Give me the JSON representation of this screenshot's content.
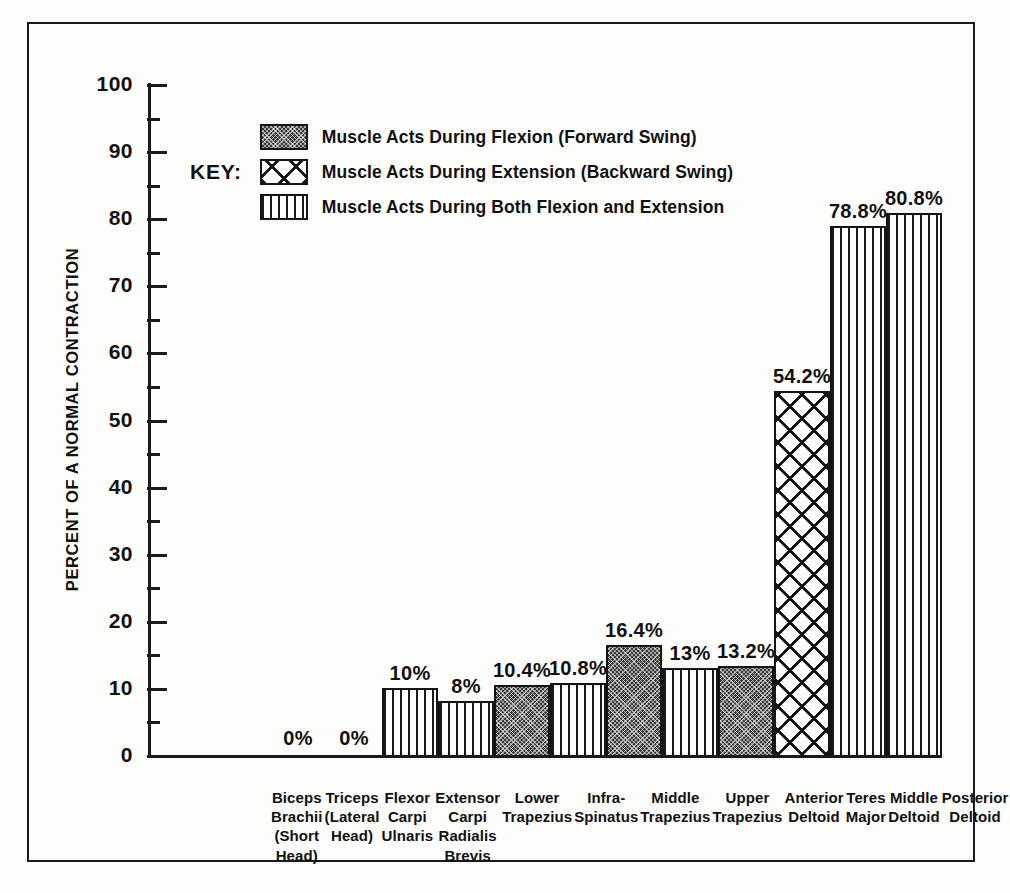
{
  "chart_data": {
    "type": "bar",
    "title": "",
    "xlabel": "",
    "ylabel": "PERCENT OF A NORMAL CONTRACTION",
    "ylim": [
      0,
      100
    ],
    "y_major_ticks": [
      0,
      10,
      20,
      30,
      40,
      50,
      60,
      70,
      80,
      90,
      100
    ],
    "y_minor_ticks": [
      5,
      15,
      25,
      35,
      45,
      55,
      65,
      75,
      85,
      95
    ],
    "y_tick_labels": [
      "0",
      "10",
      "20",
      "30",
      "40",
      "50",
      "60",
      "70",
      "80",
      "90",
      "100"
    ],
    "grid": false,
    "legend_position": "inside-upper-left",
    "categories": [
      "Biceps Brachii (Short Head)",
      "Triceps (Lateral Head)",
      "Flexor Carpi Ulnaris",
      "Extensor Carpi Radialis Brevis",
      "Lower Trapezius",
      "Infra-Spinatus",
      "Middle Trapezius",
      "Upper Trapezius",
      "Anterior Deltoid",
      "Teres Major",
      "Middle Deltoid",
      "Posterior Deltoid"
    ],
    "values": [
      0,
      0,
      10,
      8,
      10.4,
      10.8,
      16.4,
      13,
      13.2,
      54.2,
      78.8,
      80.8
    ],
    "value_labels": [
      "0%",
      "0%",
      "10%",
      "8%",
      "10.4%",
      "10.8%",
      "16.4%",
      "13%",
      "13.2%",
      "54.2%",
      "78.8%",
      "80.8%"
    ],
    "series_of_each_bar": [
      "none",
      "none",
      "both",
      "both",
      "flexion",
      "both",
      "flexion",
      "both",
      "flexion",
      "extension",
      "both",
      "both"
    ],
    "legend_entries": [
      {
        "key": "flexion",
        "label": "Muscle Acts During Flexion (Forward Swing)"
      },
      {
        "key": "extension",
        "label": "Muscle Acts During Extension (Backward Swing)"
      },
      {
        "key": "both",
        "label": "Muscle Acts During Both Flexion and Extension"
      }
    ]
  },
  "legend": {
    "title": "KEY:"
  },
  "x_axis_labels": [
    [
      "Biceps",
      "Brachii",
      "(Short",
      "Head)"
    ],
    [
      "Triceps",
      "(Lateral",
      "Head)"
    ],
    [
      "Flexor",
      "Carpi",
      "Ulnaris"
    ],
    [
      "Extensor",
      "Carpi",
      "Radialis",
      "Brevis"
    ],
    [
      "Lower",
      "Trapezius"
    ],
    [
      "Infra-",
      "Spinatus"
    ],
    [
      "Middle",
      "Trapezius"
    ],
    [
      "Upper",
      "Trapezius"
    ],
    [
      "Anterior",
      "Deltoid"
    ],
    [
      "Teres",
      "Major"
    ],
    [
      "Middle",
      "Deltoid"
    ],
    [
      "Posterior",
      "Deltoid"
    ]
  ],
  "colors": {
    "ink": "#141414",
    "paper": "#fdfdfc"
  }
}
